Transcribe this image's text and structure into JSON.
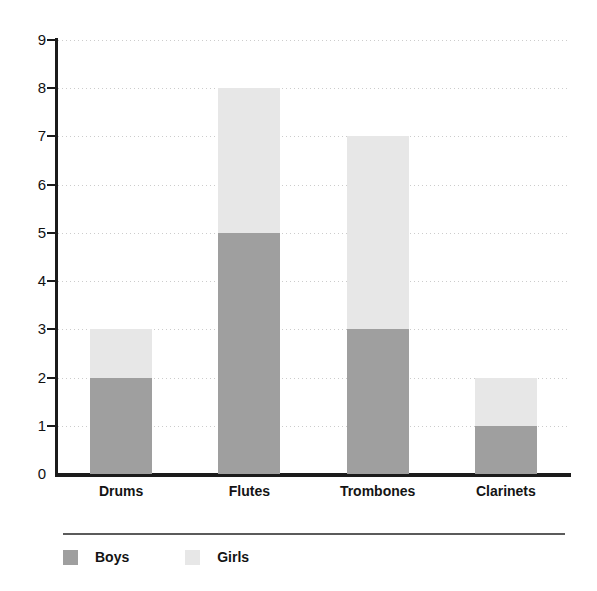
{
  "chart_data": {
    "type": "bar",
    "subtype": "stacked-bar",
    "title": "",
    "xlabel": "",
    "ylabel": "",
    "categories": [
      "Drums",
      "Flutes",
      "Trombones",
      "Clarinets"
    ],
    "series": [
      {
        "name": "Boys",
        "color": "#9f9f9f",
        "values": [
          2,
          5,
          3,
          1
        ]
      },
      {
        "name": "Girls",
        "color": "#e7e7e7",
        "values": [
          1,
          3,
          4,
          1
        ]
      }
    ],
    "totals": [
      3,
      8,
      7,
      2
    ],
    "ylim": [
      0,
      9
    ],
    "ytick_labels": [
      "0",
      "1",
      "2",
      "3",
      "4",
      "5",
      "6",
      "7",
      "8",
      "9"
    ],
    "ytick_values": [
      0,
      1,
      2,
      3,
      4,
      5,
      6,
      7,
      8,
      9
    ],
    "grid": "horizontal-dotted",
    "legend_position": "bottom-left",
    "axis_color": "#1b1b1b",
    "grid_color": "#c9c9c9",
    "background": "#ffffff"
  },
  "axis": {
    "y_ticks": [
      {
        "label": "9",
        "value": 9
      },
      {
        "label": "8",
        "value": 8
      },
      {
        "label": "7",
        "value": 7
      },
      {
        "label": "6",
        "value": 6
      },
      {
        "label": "5",
        "value": 5
      },
      {
        "label": "4",
        "value": 4
      },
      {
        "label": "3",
        "value": 3
      },
      {
        "label": "2",
        "value": 2
      },
      {
        "label": "1",
        "value": 1
      },
      {
        "label": "0",
        "value": 0
      }
    ]
  },
  "legend": {
    "items": [
      {
        "label": "Boys",
        "color": "#9f9f9f"
      },
      {
        "label": "Girls",
        "color": "#e7e7e7"
      }
    ]
  }
}
